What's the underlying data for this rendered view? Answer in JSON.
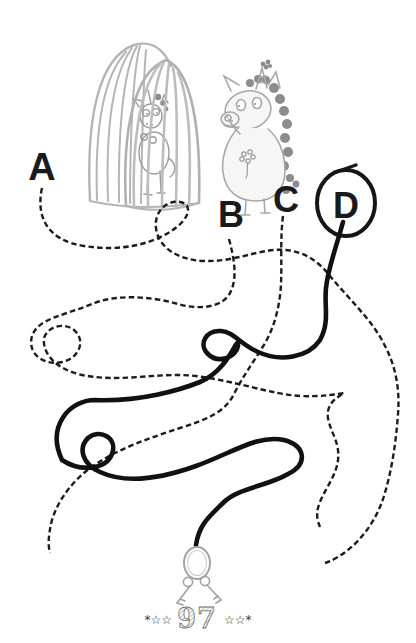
{
  "page": {
    "background": "#ffffff",
    "number": "97",
    "stars_left": "*☆☆",
    "stars_right": "☆☆*"
  },
  "puzzle": {
    "type": "tangled-line maze worksheet",
    "options": [
      {
        "label": "A",
        "line_style": "dashed"
      },
      {
        "label": "B",
        "line_style": "dashed"
      },
      {
        "label": "C",
        "line_style": "dashed"
      },
      {
        "label": "D",
        "line_style": "solid-bold"
      }
    ],
    "answer": "D",
    "answer_mark": "hand-drawn circle around letter D",
    "goal": "key ring with keys at end of line"
  },
  "illustrations": {
    "cage": "domed cage with vertical bars",
    "caged_unicorn": "unicorn locked inside the cage",
    "worried_unicorn": "unicorn standing beside the cage",
    "keys": "key ring with two keys"
  },
  "colors": {
    "ink": "#1c1c1c",
    "bold_line": "#111111",
    "sketch": "#adadad",
    "mane": "#8c8c8c"
  }
}
